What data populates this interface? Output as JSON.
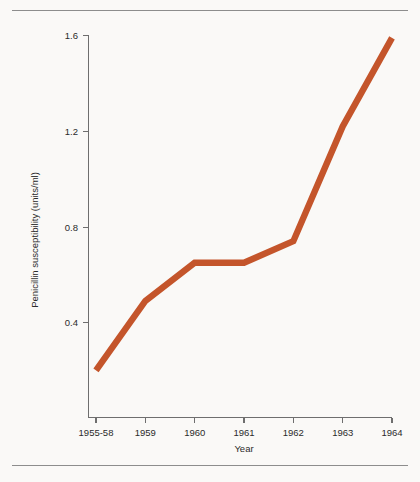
{
  "chart_data": {
    "type": "line",
    "title": "",
    "xlabel": "Year",
    "ylabel": "Penicillin susceptibility (units/ml)",
    "categories": [
      "1955-58",
      "1959",
      "1960",
      "1961",
      "1962",
      "1963",
      "1964"
    ],
    "values": [
      0.2,
      0.49,
      0.65,
      0.65,
      0.74,
      1.22,
      1.59
    ],
    "series": [
      {
        "name": "Penicillin susceptibility",
        "color": "#c4552b",
        "values": [
          0.2,
          0.49,
          0.65,
          0.65,
          0.74,
          1.22,
          1.59
        ]
      }
    ],
    "ylim": [
      0.0,
      1.6
    ],
    "xlim": [
      0,
      6
    ],
    "yticks": [
      0.4,
      0.8,
      1.2,
      1.6
    ],
    "ytick_labels": [
      "0.4",
      "0.8",
      "1.2",
      "1.6"
    ],
    "xtick_labels": [
      "1955-58",
      "1959",
      "1960",
      "1961",
      "1962",
      "1963",
      "1964"
    ],
    "grid": false,
    "legend": false,
    "legend_position": "none",
    "line_color": "#c4552b",
    "axis_color": "#6e6e6e",
    "background_color": "#faf9f7",
    "rules": {
      "top": "horizontal-rule",
      "bottom": "horizontal-rule"
    }
  }
}
